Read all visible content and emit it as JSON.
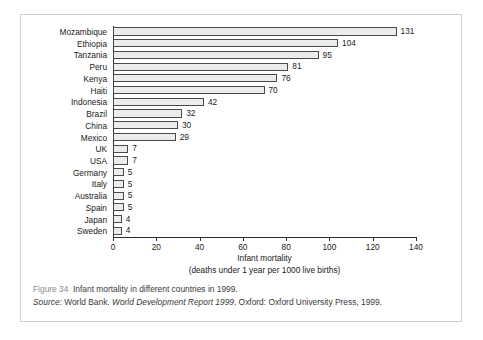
{
  "figure": {
    "caption_figure_number": "Figure 34",
    "caption_text": "Infant mortality in different countries in 1999.",
    "source_label": "Source:",
    "source_publisher": "World Bank.",
    "source_title": "World Development Report 1999",
    "source_imprint": ". Oxford: Oxford University Press, 1999."
  },
  "chart_data": {
    "type": "bar",
    "orientation": "horizontal",
    "title": "",
    "xlabel": "Infant mortality",
    "xlabel_sub": "(deaths under 1 year per 1000 live births)",
    "ylabel": "",
    "xlim": [
      0,
      140
    ],
    "xticks": [
      0,
      20,
      40,
      60,
      80,
      100,
      120,
      140
    ],
    "grid": false,
    "legend": false,
    "bar_fill": "#ececec",
    "bar_border": "#4a4a4a",
    "categories": [
      "Mozambique",
      "Ethiopia",
      "Tanzania",
      "Peru",
      "Kenya",
      "Haiti",
      "Indonesia",
      "Brazil",
      "China",
      "Mexico",
      "UK",
      "USA",
      "Germany",
      "Italy",
      "Australia",
      "Spain",
      "Japan",
      "Sweden"
    ],
    "values": [
      131,
      104,
      95,
      81,
      76,
      70,
      42,
      32,
      30,
      29,
      7,
      7,
      5,
      5,
      5,
      5,
      4,
      4
    ]
  }
}
